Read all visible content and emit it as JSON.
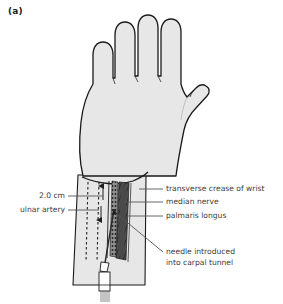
{
  "figure": {
    "panel_tag": "(a)"
  },
  "labels": {
    "distance": "2.0 cm",
    "ulnar_artery": "ulnar artery",
    "transverse_crease": "transverse crease of wrist",
    "median_nerve": "median nerve",
    "palmaris_longus": "palmaris longus",
    "needle_line1": "needle introduced",
    "needle_line2": "into carpal tunnel"
  },
  "colors": {
    "skin_fill": "#e7e7e7",
    "outline": "#1a1a1a",
    "tendon_dark": "#4a4a4a",
    "nerve_dark": "#2e2e2e",
    "text": "#3b3b3b",
    "leader": "#555555",
    "background": "#ffffff"
  }
}
